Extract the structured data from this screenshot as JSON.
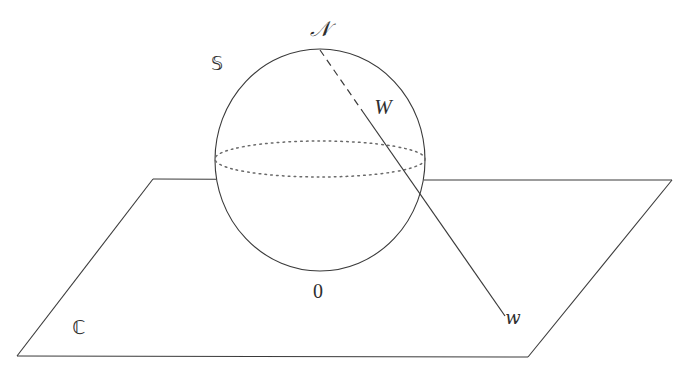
{
  "figure": {
    "background_color": "#ffffff",
    "stroke_color": "#3a3a3a",
    "label_color": "#2f2f2f",
    "width": 689,
    "height": 381
  },
  "labels": {
    "north_pole": "𝒩",
    "sphere": "𝕊",
    "point_on_sphere": "W",
    "origin": "0",
    "point_on_plane": "w",
    "plane": "ℂ"
  },
  "label_positions": {
    "north_pole": {
      "x": 320,
      "y": 29
    },
    "sphere": {
      "x": 217,
      "y": 63
    },
    "point_on_sphere": {
      "x": 383,
      "y": 107
    },
    "origin": {
      "x": 318,
      "y": 291
    },
    "point_on_plane": {
      "x": 513,
      "y": 318
    },
    "plane": {
      "x": 79,
      "y": 327
    }
  },
  "geometry": {
    "sphere": {
      "center_x": 320,
      "center_y": 160,
      "radius_x": 105,
      "radius_y": 111,
      "style": "solid"
    },
    "equator": {
      "center_x": 320,
      "center_y": 159,
      "radius_x": 105,
      "radius_y": 18,
      "style": "dotted"
    },
    "plane": {
      "corners": [
        {
          "x": 153,
          "y": 179
        },
        {
          "x": 672,
          "y": 180
        },
        {
          "x": 528,
          "y": 357
        },
        {
          "x": 17,
          "y": 356
        }
      ],
      "style": "solid"
    },
    "projection_ray": {
      "from": {
        "x": 320,
        "y": 50
      },
      "to": {
        "x": 505,
        "y": 316
      },
      "dashed_until": {
        "x": 363,
        "y": 112
      },
      "dashed_style": "dashed",
      "solid_style": "solid"
    },
    "points": [
      {
        "name": "north_pole",
        "x": 320,
        "y": 50
      },
      {
        "name": "origin",
        "x": 320,
        "y": 270
      },
      {
        "name": "point_on_sphere",
        "x": 363,
        "y": 112
      },
      {
        "name": "point_on_plane",
        "x": 505,
        "y": 316
      }
    ]
  }
}
